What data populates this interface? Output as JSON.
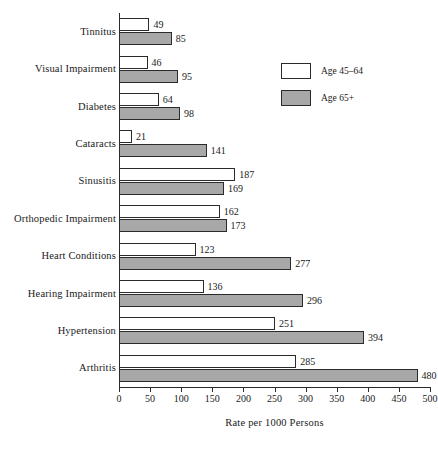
{
  "chart_data": {
    "type": "bar",
    "orientation": "horizontal",
    "title": "",
    "xlabel": "Rate per 1000 Persons",
    "ylabel": "",
    "xlim": [
      0,
      500
    ],
    "xticks": [
      0,
      50,
      100,
      150,
      200,
      250,
      300,
      350,
      400,
      450,
      500
    ],
    "grid": false,
    "legend_position": "upper right",
    "categories": [
      "Tinnitus",
      "Visual Impairment",
      "Diabetes",
      "Cataracts",
      "Sinusitis",
      "Orthopedic Impairment",
      "Heart Conditions",
      "Hearing Impairment",
      "Hypertension",
      "Arthritis"
    ],
    "series": [
      {
        "name": "Age 45–64",
        "color": "#ffffff",
        "values": [
          49,
          46,
          64,
          21,
          187,
          162,
          123,
          136,
          251,
          285
        ]
      },
      {
        "name": "Age 65+",
        "color": "#a8a8a8",
        "values": [
          85,
          95,
          98,
          141,
          169,
          173,
          277,
          296,
          394,
          480
        ]
      }
    ]
  },
  "legend": {
    "items": [
      {
        "label": "Age 45–64",
        "swatch": "light"
      },
      {
        "label": "Age 65+",
        "swatch": "dark"
      }
    ]
  },
  "axis": {
    "x_title": "Rate per 1000 Persons"
  }
}
